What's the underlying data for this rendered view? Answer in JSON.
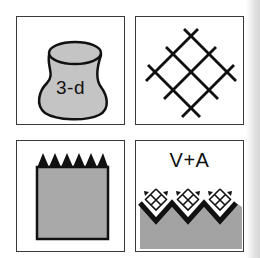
{
  "panels": [
    {
      "id": "top-left",
      "label": "3-d",
      "depicts": "three-dimensional grey blob/vessel shape"
    },
    {
      "id": "top-right",
      "label": "",
      "depicts": "diamond lattice / crosshatch grid"
    },
    {
      "id": "bottom-left",
      "label": "",
      "depicts": "grey rectangle with saw-tooth black top edge"
    },
    {
      "id": "bottom-right",
      "label": "V+A",
      "depicts": "grey zig-zag surface with crosshatched lattice and arrows"
    }
  ],
  "colors": {
    "border": "#3a3a3a",
    "fill_grey": "#a8a8a8",
    "ink": "#111111",
    "background": "#ffffff"
  }
}
